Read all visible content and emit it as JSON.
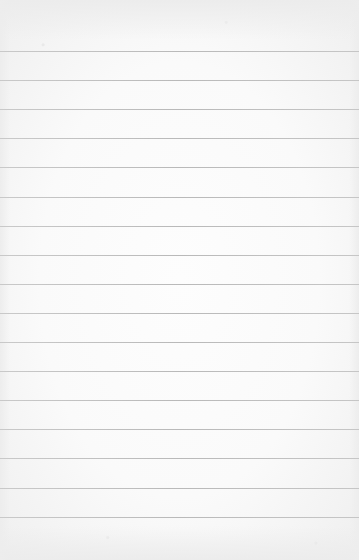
{
  "paper": {
    "kind": "lined-paper",
    "background_color": "#fafafa",
    "line_color": "#bdbdbd",
    "line_count": 17,
    "first_line_y": 51,
    "line_spacing": 29.1,
    "text": ""
  }
}
